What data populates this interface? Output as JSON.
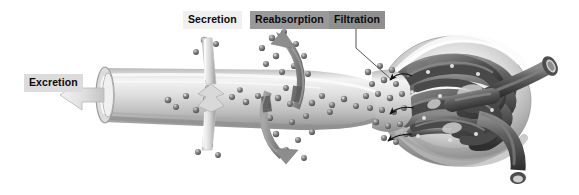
{
  "figure": {
    "background_color": "#ffffff"
  },
  "labels": {
    "excretion": "Excretion",
    "secretion": "Secretion",
    "reabsorption": "Reabsorption",
    "filtration": "Filtration"
  },
  "label_styles": {
    "excretion_bg": "#dcdcdc",
    "secretion_bg": "#f0f0f0",
    "reabsorption_bg": "#9a9a9a",
    "filtration_bg": "#8f8f8f",
    "text_color": "#0a0a0a"
  },
  "anatomy": {
    "tubule_color": "#c9c9c9",
    "tubule_highlight": "#f2f2f2",
    "tubule_shadow": "#8e8e8e",
    "capsule_color": "#e3e3e3",
    "capsule_rim": "#b5b5b5",
    "capillary_color": "#5d5d5d",
    "capillary_dark": "#3a3a3a",
    "capillary_highlight": "#9a9a9a",
    "particle_color": "#6b6b6b",
    "particle_highlight": "#d8d8d8",
    "arrow_gray": "#8c8c8c",
    "arrow_light": "#e8e8e8",
    "arrow_thin": "#111111",
    "leader_line": "#555555"
  },
  "parts": [
    {
      "name": "renal-tubule",
      "description": "Light gray cylindrical tubule running left to right"
    },
    {
      "name": "tubule-open-end",
      "description": "Open cut end of tubule at left where urine exits"
    },
    {
      "name": "bowmans-capsule",
      "description": "Light ring-shaped capsule surrounding the glomerulus"
    },
    {
      "name": "glomerulus",
      "description": "Dark tangled ball of capillaries"
    },
    {
      "name": "afferent-arteriole",
      "description": "Upper dark vessel exiting to the right"
    },
    {
      "name": "efferent-arteriole",
      "description": "Lower dark vessel curving down to the right"
    }
  ],
  "arrows": [
    {
      "name": "excretion-arrow",
      "direction": "left",
      "style": "thick-light-gray"
    },
    {
      "name": "secretion-arrow",
      "direction": "vertical-into-tubule",
      "style": "light-double-headed"
    },
    {
      "name": "reabsorption-arrow-up",
      "direction": "up-left",
      "style": "curved-gray"
    },
    {
      "name": "reabsorption-arrow-down",
      "direction": "down-right",
      "style": "curved-gray"
    },
    {
      "name": "filtration-arrow-1",
      "direction": "left",
      "style": "thin-black-curved"
    },
    {
      "name": "filtration-arrow-2",
      "direction": "left",
      "style": "thin-black-curved"
    },
    {
      "name": "filtration-arrow-3",
      "direction": "left",
      "style": "thin-black-curved"
    }
  ]
}
